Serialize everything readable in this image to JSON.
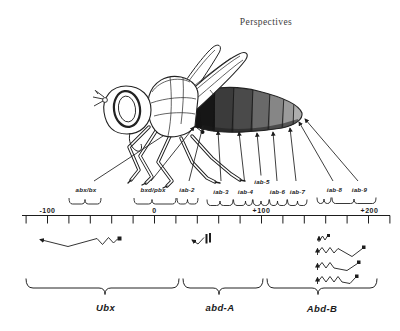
{
  "header": {
    "title": "Perspectives"
  },
  "fly": {
    "description": "Lateral view of adult Drosophila; abdominal segments shaded dark (anterior) to light (posterior)",
    "abdomen_segment_colors": [
      "#161616",
      "#3b3b3b",
      "#4a4a4a",
      "#696969",
      "#868686",
      "#9b9b9b",
      "#aeaeae"
    ]
  },
  "gene_map": {
    "regulatory_regions": [
      {
        "label": "abx/bx"
      },
      {
        "label": "bxd/pbx"
      },
      {
        "label": "iab-2"
      },
      {
        "label": "iab-3"
      },
      {
        "label": "iab-4"
      },
      {
        "label": "iab-5"
      },
      {
        "label": "iab-6"
      },
      {
        "label": "iab-7"
      },
      {
        "label": "iab-8"
      },
      {
        "label": "iab-9"
      }
    ],
    "ruler": {
      "tick_labels": [
        "-100",
        "0",
        "+100",
        "+200"
      ],
      "axis_min": -120,
      "axis_max": 220,
      "tick_step": 20
    },
    "genes": [
      {
        "label": "Ubx"
      },
      {
        "label": "abd-A"
      },
      {
        "label": "Abd-B"
      }
    ]
  },
  "colors": {
    "ink": "#222222",
    "background": "#ffffff",
    "text": "#1b1b1b"
  }
}
